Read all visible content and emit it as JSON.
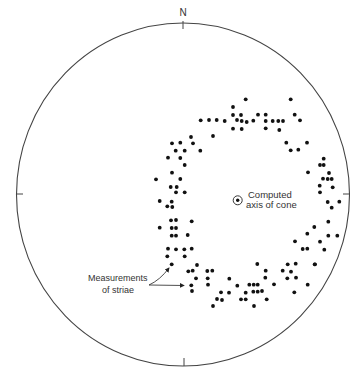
{
  "diagram": {
    "type": "stereonet",
    "north_label": "N",
    "net": {
      "cx": 183,
      "cy": 194.5,
      "rx": 166.5,
      "ry": 171.5,
      "stroke": "#444444"
    },
    "ticks": [
      {
        "name": "north-tick",
        "x1": 183,
        "y1": 21,
        "x2": 183,
        "y2": 29
      },
      {
        "name": "south-tick",
        "x1": 184,
        "y1": 358,
        "x2": 184,
        "y2": 366
      },
      {
        "name": "west-tick",
        "x1": 16,
        "y1": 194,
        "x2": 23,
        "y2": 194
      },
      {
        "name": "east-tick",
        "x1": 343,
        "y1": 194,
        "x2": 350,
        "y2": 194
      }
    ],
    "axis": {
      "label_line1": "Computed",
      "label_line2": "axis of cone",
      "x": 237.7,
      "y": 200.3,
      "r": 4.5
    },
    "striae_label": {
      "line1": "Measurements",
      "line2": "of striae"
    },
    "dot_color": "#111111",
    "dots": [
      [
        245.7,
        99.3
      ],
      [
        290.7,
        99.3
      ],
      [
        233,
        107
      ],
      [
        233,
        115
      ],
      [
        241,
        115
      ],
      [
        258,
        114.7
      ],
      [
        265.7,
        114.7
      ],
      [
        294.7,
        114.7
      ],
      [
        200.7,
        120.3
      ],
      [
        209,
        120
      ],
      [
        216.7,
        120
      ],
      [
        224.7,
        121
      ],
      [
        237,
        120
      ],
      [
        241.7,
        121
      ],
      [
        246.7,
        122
      ],
      [
        253.3,
        120.7
      ],
      [
        265.7,
        121
      ],
      [
        272.7,
        121
      ],
      [
        278.3,
        121
      ],
      [
        283,
        121
      ],
      [
        300,
        120.3
      ],
      [
        233,
        128.7
      ],
      [
        241.7,
        129
      ],
      [
        265.7,
        128.3
      ],
      [
        279.3,
        130
      ],
      [
        191,
        137
      ],
      [
        213,
        136
      ],
      [
        193,
        143.3
      ],
      [
        172,
        143.3
      ],
      [
        180.3,
        142.7
      ],
      [
        286.3,
        142.7
      ],
      [
        307,
        142.7
      ],
      [
        175.7,
        150.7
      ],
      [
        184.7,
        150.7
      ],
      [
        200.3,
        150.7
      ],
      [
        290.7,
        150.3
      ],
      [
        298.3,
        149.7
      ],
      [
        168,
        157.7
      ],
      [
        180.3,
        158
      ],
      [
        323.7,
        158.7
      ],
      [
        184.7,
        165
      ],
      [
        320,
        165
      ],
      [
        323.7,
        165
      ],
      [
        172,
        172.7
      ],
      [
        308,
        172.3
      ],
      [
        329,
        173
      ],
      [
        180.3,
        179
      ],
      [
        156,
        179.3
      ],
      [
        323,
        178.7
      ],
      [
        327.7,
        179
      ],
      [
        331.7,
        179
      ],
      [
        319.7,
        185.7
      ],
      [
        332.7,
        187.3
      ],
      [
        170.7,
        187
      ],
      [
        176.7,
        187
      ],
      [
        176,
        192.3
      ],
      [
        184.7,
        192.3
      ],
      [
        320,
        192.3
      ],
      [
        159.7,
        201
      ],
      [
        171.7,
        201.7
      ],
      [
        327.7,
        202
      ],
      [
        339.3,
        201.7
      ],
      [
        167.3,
        206.3
      ],
      [
        172.3,
        207
      ],
      [
        331.7,
        207.7
      ],
      [
        171,
        220.3
      ],
      [
        176,
        220
      ],
      [
        191.7,
        221.3
      ],
      [
        328.3,
        221.7
      ],
      [
        314.3,
        227
      ],
      [
        159.7,
        227.7
      ],
      [
        171.7,
        228
      ],
      [
        176,
        228
      ],
      [
        307.3,
        233.7
      ],
      [
        171.7,
        235.7
      ],
      [
        176,
        235.7
      ],
      [
        187.7,
        235
      ],
      [
        328.3,
        235.7
      ],
      [
        337.3,
        235.7
      ],
      [
        295,
        241.3
      ],
      [
        320,
        241.7
      ],
      [
        168,
        248.7
      ],
      [
        176,
        249.3
      ],
      [
        184.3,
        249.3
      ],
      [
        191.7,
        248.7
      ],
      [
        302.7,
        249
      ],
      [
        307.3,
        248.7
      ],
      [
        324.3,
        249.7
      ],
      [
        167.3,
        256.3
      ],
      [
        184.7,
        256.3
      ],
      [
        171.7,
        264.3
      ],
      [
        197,
        265
      ],
      [
        257.3,
        264
      ],
      [
        287.7,
        264.3
      ],
      [
        295.7,
        263.7
      ],
      [
        314.7,
        264.3
      ],
      [
        315,
        264.3
      ],
      [
        188.3,
        271.3
      ],
      [
        192.7,
        270.7
      ],
      [
        207.3,
        271
      ],
      [
        212.3,
        270.7
      ],
      [
        265.7,
        270.7
      ],
      [
        282.7,
        270.7
      ],
      [
        291,
        271.7
      ],
      [
        196,
        278.3
      ],
      [
        207.7,
        278.3
      ],
      [
        229.3,
        278.7
      ],
      [
        265.3,
        277.7
      ],
      [
        287.3,
        278.3
      ],
      [
        296,
        277.7
      ],
      [
        191.3,
        285.3
      ],
      [
        208,
        284.7
      ],
      [
        237.3,
        285.7
      ],
      [
        249.3,
        284.7
      ],
      [
        253.7,
        284.7
      ],
      [
        257.7,
        284.7
      ],
      [
        274,
        284.3
      ],
      [
        307.7,
        284.7
      ],
      [
        192,
        291
      ],
      [
        221,
        292.3
      ],
      [
        229,
        292.7
      ],
      [
        245.7,
        292.7
      ],
      [
        253.3,
        291.7
      ],
      [
        257.7,
        291.7
      ],
      [
        262,
        291
      ],
      [
        294.3,
        292.3
      ],
      [
        217,
        299
      ],
      [
        222,
        300
      ],
      [
        241,
        299.3
      ],
      [
        245.7,
        299.3
      ],
      [
        266.7,
        299.3
      ],
      [
        213,
        306
      ],
      [
        254,
        306
      ]
    ]
  }
}
